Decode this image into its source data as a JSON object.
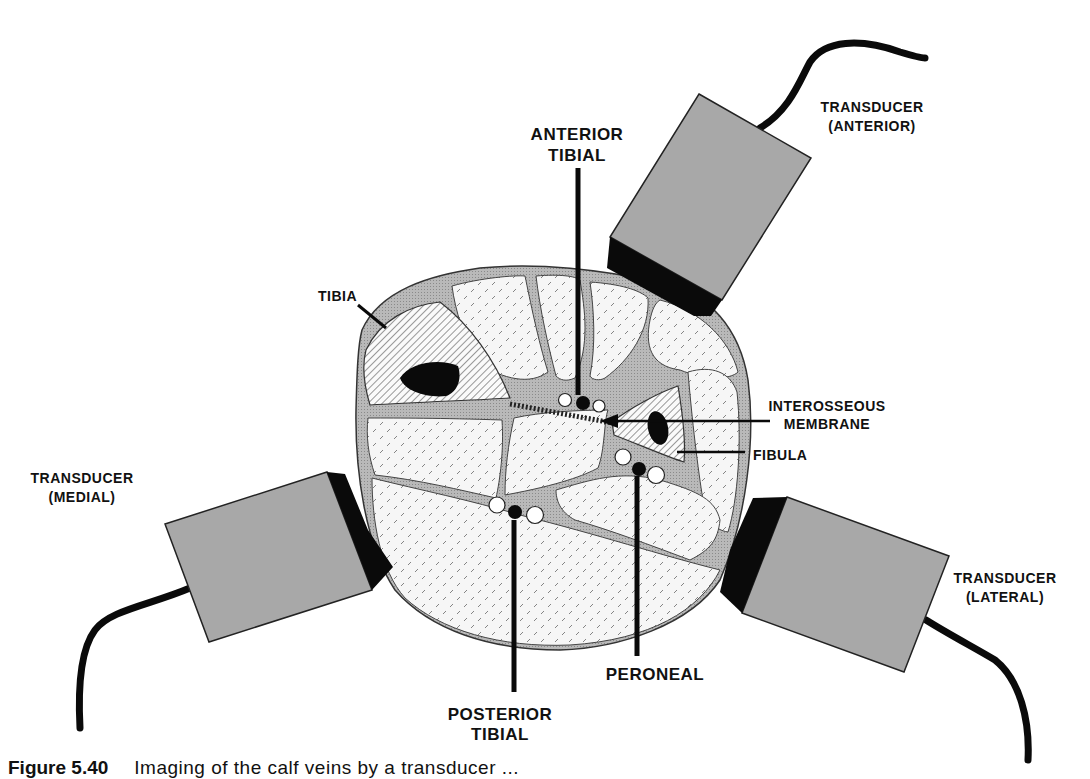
{
  "figure": {
    "labels": {
      "anterior_tibial": [
        "ANTERIOR",
        "TIBIAL"
      ],
      "tibia": "TIBIA",
      "interosseous_membrane": [
        "INTEROSSEOUS",
        "MEMBRANE"
      ],
      "fibula": "FIBULA",
      "posterior_tibial": [
        "POSTERIOR",
        "TIBIAL"
      ],
      "peroneal": "PERONEAL",
      "transducer_anterior": [
        "TRANSDUCER",
        "(ANTERIOR)"
      ],
      "transducer_medial": [
        "TRANSDUCER",
        "(MEDIAL)"
      ],
      "transducer_lateral": [
        "TRANSDUCER",
        "(LATERAL)"
      ]
    },
    "colors": {
      "transducer_body": "#a8a8a8",
      "transducer_face": "#0a0a0a",
      "fascia": "#b5b5b5",
      "muscle": "#f4f4f4",
      "ink": "#111111"
    }
  },
  "caption": {
    "number": "Figure 5.40",
    "text": "Imaging of the calf veins by a transducer ..."
  }
}
